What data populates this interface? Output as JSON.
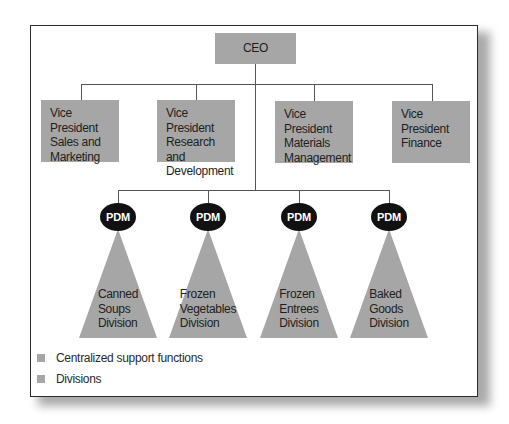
{
  "colors": {
    "support_box": "#a6a6a6",
    "division_triangle": "#a6a6a6",
    "pdm_oval": "#111111",
    "connector": "#555555",
    "frame_border": "#2b2b2b"
  },
  "chart": {
    "ceo": {
      "label": "CEO"
    },
    "vice_presidents": [
      {
        "label": "Vice President\nSales and\nMarketing"
      },
      {
        "label": "Vice President\nResearch and\nDevelopment"
      },
      {
        "label": "Vice President\nMaterials\nManagement"
      },
      {
        "label": "Vice President\nFinance"
      }
    ],
    "divisions": [
      {
        "pdm_label": "PDM",
        "label": "Canned\nSoups\nDivision"
      },
      {
        "pdm_label": "PDM",
        "label": "Frozen\nVegetables\nDivision"
      },
      {
        "pdm_label": "PDM",
        "label": "Frozen\nEntrees\nDivision"
      },
      {
        "pdm_label": "PDM",
        "label": "Baked\nGoods\nDivision"
      }
    ]
  },
  "legend": [
    {
      "label": "Centralized support functions",
      "color": "#a6a6a6"
    },
    {
      "label": "Divisions",
      "color": "#a6a6a6"
    }
  ]
}
